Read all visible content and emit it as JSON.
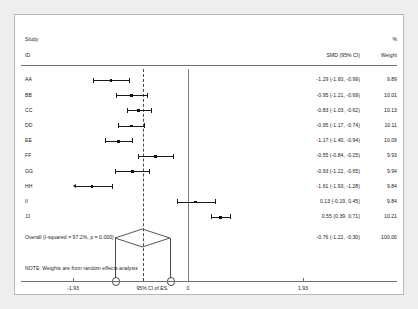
{
  "chart_data": {
    "type": "forest",
    "title": "",
    "columns": {
      "study_header_line1": "Study",
      "study_header_line2": "ID",
      "effect_header": "SMD (95% CI)",
      "weight_header_line1": "%",
      "weight_header_line2": "Weight"
    },
    "xlabel": "95% CI of ES.",
    "xlim": [
      -1.93,
      1.93
    ],
    "xticks": [
      -1.93,
      0,
      1.93
    ],
    "xticklabels": [
      "-1.93",
      "0",
      "1.93"
    ],
    "null_line": 0,
    "pooled_line": -0.76,
    "effect_measure": "SMD",
    "note": "NOTE: Weights are from random effects analysis",
    "rows": [
      {
        "id": "AA",
        "est": -1.29,
        "lo": -1.6,
        "hi": -0.99,
        "label": "-1.29 (-1.60, -0.99)",
        "weight": "9.89",
        "weight_num": 9.89,
        "clipped_left": false
      },
      {
        "id": "BB",
        "est": -0.95,
        "lo": -1.21,
        "hi": -0.69,
        "label": "-0.95 (-1.21, -0.69)",
        "weight": "10.01",
        "weight_num": 10.01,
        "clipped_left": false
      },
      {
        "id": "CC",
        "est": -0.83,
        "lo": -1.03,
        "hi": -0.62,
        "label": "-0.83 (-1.03, -0.62)",
        "weight": "10.13",
        "weight_num": 10.13,
        "clipped_left": false
      },
      {
        "id": "DD",
        "est": -0.95,
        "lo": -1.17,
        "hi": -0.74,
        "label": "-0.95 (-1.17, -0.74)",
        "weight": "10.11",
        "weight_num": 10.11,
        "clipped_left": false
      },
      {
        "id": "EE",
        "est": -1.17,
        "lo": -1.4,
        "hi": -0.94,
        "label": "-1.17 (-1.40, -0.94)",
        "weight": "10.09",
        "weight_num": 10.09,
        "clipped_left": false
      },
      {
        "id": "FF",
        "est": -0.55,
        "lo": -0.84,
        "hi": -0.25,
        "label": "-0.55 (-0.84, -0.25)",
        "weight": "9.93",
        "weight_num": 9.93,
        "clipped_left": false
      },
      {
        "id": "GG",
        "est": -0.93,
        "lo": -1.22,
        "hi": -0.65,
        "label": "-0.93 (-1.22, -0.65)",
        "weight": "9.94",
        "weight_num": 9.94,
        "clipped_left": false
      },
      {
        "id": "HH",
        "est": -1.61,
        "lo": -1.93,
        "hi": -1.28,
        "label": "-1.61 (-1.93, -1.28)",
        "weight": "9.84",
        "weight_num": 9.84,
        "clipped_left": true
      },
      {
        "id": "II",
        "est": 0.13,
        "lo": -0.19,
        "hi": 0.45,
        "label": "0.13 (-0.19, 0.45)",
        "weight": "9.84",
        "weight_num": 9.84,
        "clipped_left": false
      },
      {
        "id": "JJ",
        "est": 0.55,
        "lo": 0.39,
        "hi": 0.71,
        "label": "0.55 (0.39, 0.71)",
        "weight": "10.21",
        "weight_num": 10.21,
        "clipped_left": false
      }
    ],
    "overall": {
      "id": "Overall  (I-squared = 97.2%, p = 0.000)",
      "est": -0.76,
      "lo": -1.22,
      "hi": -0.3,
      "label": "-0.76 (-1.22, -0.30)",
      "weight": "100.00"
    },
    "colors": {
      "marker": "#111111",
      "line": "#1a1a1a",
      "axis": "#6f6f6f",
      "null": "#7d7d7d",
      "pooled": "#4a4a4a",
      "text": "#1a1a1a",
      "panel_bg": "#ffffff",
      "outer_bg": "#eeeeee"
    }
  }
}
